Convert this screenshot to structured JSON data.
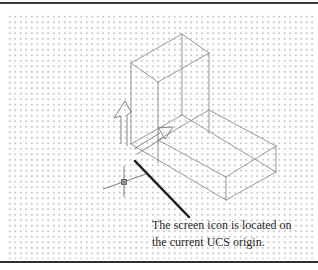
{
  "figure": {
    "type": "manual-illustration",
    "caption": {
      "line1": "The screen icon is located on",
      "line2": "the current UCS origin."
    }
  },
  "icons": {
    "ucs-icon": "outlined X and Y axis arrows of the AutoCAD UCS screen icon",
    "crosshair-icon": "isometric crosshair cursor with square pickbox",
    "leader-arrow": "thick diagonal leader line pointing from caption to UCS origin"
  },
  "colors": {
    "background": "#ffffff",
    "grid_dot": "#c8c8c8",
    "wireframe": "#8c8c8c",
    "ucs_icon_stroke": "#787878",
    "crosshair_stroke": "#5a5a5a",
    "pickbox_fill": "#909090",
    "leader": "#1c1c1c",
    "caption_text": "#1f1f1f",
    "rule": "#3d3d3d"
  }
}
